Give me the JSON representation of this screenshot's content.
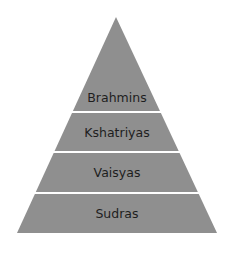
{
  "diagram": {
    "fill_color": "#8f8f8f",
    "separator_color": "#ffffff",
    "tiers": [
      {
        "label": "Brahmins",
        "y_top": 17,
        "y_bottom": 111,
        "label_y": 90
      },
      {
        "label": "Kshatriyas",
        "y_top": 113,
        "y_bottom": 151,
        "label_y": 125
      },
      {
        "label": "Vaisyas",
        "y_top": 153,
        "y_bottom": 192,
        "label_y": 165
      },
      {
        "label": "Sudras",
        "y_top": 194,
        "y_bottom": 233,
        "label_y": 206
      }
    ]
  }
}
